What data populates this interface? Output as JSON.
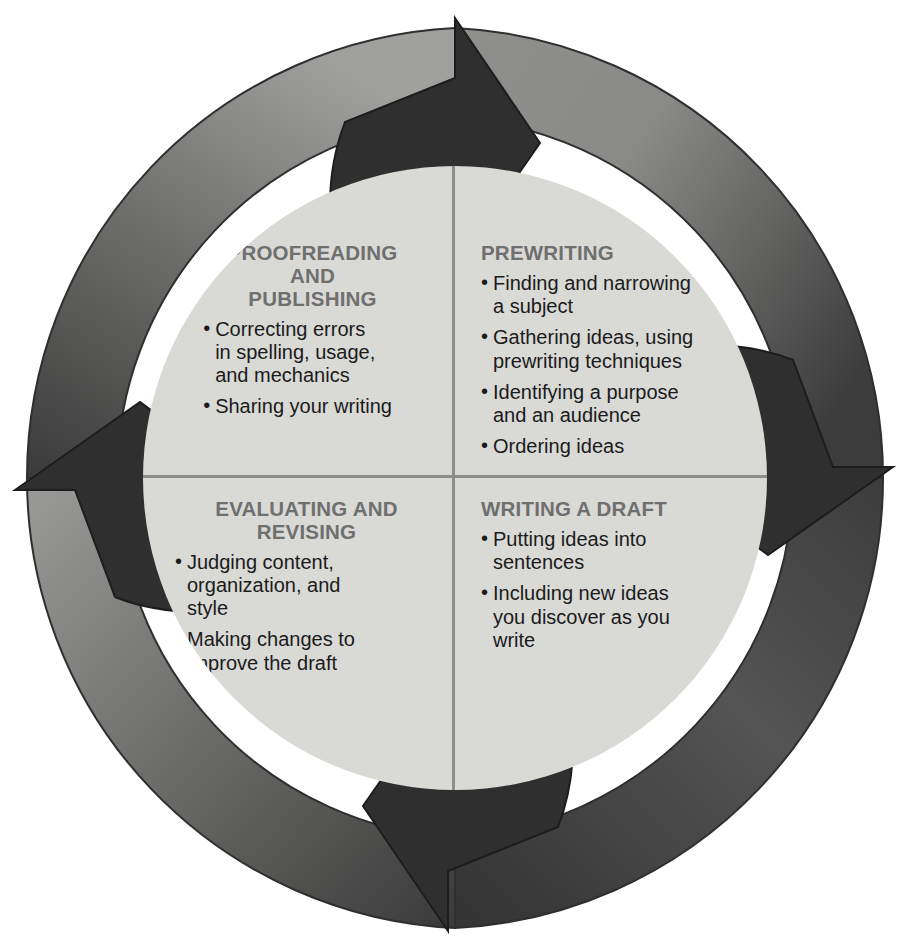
{
  "diagram": {
    "type": "cyclical-process-wheel",
    "colors": {
      "arrowhead": "#2f2f2f",
      "ring_light": "#9a9a98",
      "ring_dark": "#3a3a3a",
      "inner_fill": "#d9d9d6",
      "divider": "#8d8d8a",
      "heading_text": "#6f6f6f",
      "body_text": "#1b1b1b",
      "background": "#ffffff"
    },
    "ring": {
      "direction": "clockwise",
      "arrowheads": [
        {
          "name": "top-arrowhead",
          "position": "top",
          "points": "right"
        },
        {
          "name": "right-arrowhead",
          "position": "right",
          "points": "down"
        },
        {
          "name": "bottom-arrowhead",
          "position": "bottom",
          "points": "left"
        },
        {
          "name": "left-arrowhead",
          "position": "left",
          "points": "up"
        }
      ]
    },
    "quadrants": [
      {
        "id": "prewriting",
        "position": "top-right",
        "title": "PREWRITING",
        "bullets": [
          "Finding and narrowing\na subject",
          "Gathering ideas, using\nprewriting techniques",
          "Identifying a purpose\nand an audience",
          "Ordering ideas"
        ]
      },
      {
        "id": "writing-a-draft",
        "position": "bottom-right",
        "title": "WRITING A DRAFT",
        "bullets": [
          "Putting ideas into\nsentences",
          "Including new ideas\nyou discover as you\nwrite"
        ]
      },
      {
        "id": "evaluating-and-revising",
        "position": "bottom-left",
        "title": "EVALUATING AND\nREVISING",
        "bullets": [
          "Judging content,\norganization, and\nstyle",
          "Making changes to\nimprove the draft"
        ]
      },
      {
        "id": "proofreading-and-publishing",
        "position": "top-left",
        "title": "PROOFREADING\nAND\nPUBLISHING",
        "bullets": [
          "Correcting errors\nin spelling, usage,\nand mechanics",
          "Sharing your writing"
        ]
      }
    ]
  }
}
